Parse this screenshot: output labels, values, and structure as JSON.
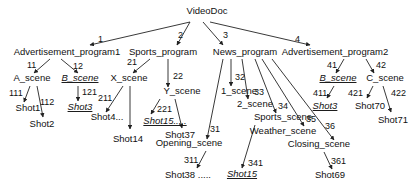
{
  "diagram": {
    "root": {
      "id": "root",
      "label": "VideoDoc",
      "x": 207,
      "y": 14
    },
    "nodes": [
      {
        "id": "ap1",
        "label": "Advertisement_program1",
        "x": 67,
        "y": 55
      },
      {
        "id": "sp",
        "label": "Sports_program",
        "x": 163,
        "y": 55
      },
      {
        "id": "np",
        "label": "News_program",
        "x": 245,
        "y": 55
      },
      {
        "id": "ap2",
        "label": "Advertisement_program2",
        "x": 335,
        "y": 55
      },
      {
        "id": "as",
        "label": "A_scene",
        "x": 32,
        "y": 81
      },
      {
        "id": "bs1",
        "label": "B_scene",
        "x": 80,
        "y": 81,
        "italic": true
      },
      {
        "id": "xs",
        "label": "X_scene",
        "x": 129,
        "y": 81
      },
      {
        "id": "ys",
        "label": "Y_scene",
        "x": 182,
        "y": 94
      },
      {
        "id": "s1",
        "label": "1_scene",
        "x": 239,
        "y": 94
      },
      {
        "id": "s2",
        "label": "2_scene",
        "x": 255,
        "y": 107
      },
      {
        "id": "sps",
        "label": "Sports_scene",
        "x": 283,
        "y": 120
      },
      {
        "id": "ws",
        "label": "Weather_scene",
        "x": 283,
        "y": 134
      },
      {
        "id": "os",
        "label": "Opening_scene",
        "x": 189,
        "y": 146
      },
      {
        "id": "cs",
        "label": "Closing_scene",
        "x": 319,
        "y": 147
      },
      {
        "id": "bs2",
        "label": "B_scene",
        "x": 338,
        "y": 81,
        "italic": true
      },
      {
        "id": "cs2",
        "label": "C_scene",
        "x": 385,
        "y": 81
      },
      {
        "id": "sh1",
        "label": "Shot1",
        "x": 28,
        "y": 111
      },
      {
        "id": "sh2",
        "label": "Shot2",
        "x": 42,
        "y": 127
      },
      {
        "id": "sh3a",
        "label": "Shot3",
        "x": 80,
        "y": 110,
        "italic": true
      },
      {
        "id": "sh4",
        "label": "Shot4...",
        "x": 107,
        "y": 120
      },
      {
        "id": "sh14",
        "label": "Shot14",
        "x": 128,
        "y": 142
      },
      {
        "id": "sh15a",
        "label": "Shot15.....",
        "x": 165,
        "y": 124,
        "italic": true
      },
      {
        "id": "sh37",
        "label": "Shot37",
        "x": 180,
        "y": 138
      },
      {
        "id": "sh38",
        "label": "Shot38 .....",
        "x": 188,
        "y": 178
      },
      {
        "id": "sh15b",
        "label": "Shot15",
        "x": 242,
        "y": 177,
        "italic": true
      },
      {
        "id": "sh69",
        "label": "Shot69",
        "x": 330,
        "y": 178
      },
      {
        "id": "sh3b",
        "label": "Shot3",
        "x": 325,
        "y": 109,
        "italic": true
      },
      {
        "id": "sh70",
        "label": "Shot70",
        "x": 370,
        "y": 109
      },
      {
        "id": "sh71",
        "label": "Shot71",
        "x": 393,
        "y": 123
      }
    ],
    "edges": [
      {
        "from": "root",
        "to": "ap1",
        "label": "1",
        "x1": 190,
        "y1": 22,
        "x2": 90,
        "y2": 45,
        "lx": 98,
        "ly": 42
      },
      {
        "from": "root",
        "to": "sp",
        "label": "2",
        "x1": 190,
        "y1": 22,
        "x2": 177,
        "y2": 45,
        "lx": 178,
        "ly": 38
      },
      {
        "from": "root",
        "to": "np",
        "label": "3",
        "x1": 203,
        "y1": 22,
        "x2": 223,
        "y2": 45,
        "lx": 223,
        "ly": 38
      },
      {
        "from": "root",
        "to": "ap2",
        "label": "4",
        "x1": 210,
        "y1": 22,
        "x2": 310,
        "y2": 45,
        "lx": 295,
        "ly": 42
      },
      {
        "from": "ap1",
        "to": "as",
        "label": "11",
        "x1": 50,
        "y1": 59,
        "x2": 34,
        "y2": 73,
        "lx": 27,
        "ly": 68
      },
      {
        "from": "ap1",
        "to": "bs1",
        "label": "12",
        "x1": 61,
        "y1": 59,
        "x2": 78,
        "y2": 73,
        "lx": 73,
        "ly": 69
      },
      {
        "from": "sp",
        "to": "xs",
        "label": "21",
        "x1": 150,
        "y1": 59,
        "x2": 133,
        "y2": 73,
        "lx": 127,
        "ly": 65
      },
      {
        "from": "sp",
        "to": "ys",
        "label": "22",
        "x1": 168,
        "y1": 59,
        "x2": 168,
        "y2": 87,
        "lx": 173,
        "ly": 79
      },
      {
        "from": "np",
        "to": "os",
        "label": "31",
        "x1": 223,
        "y1": 59,
        "x2": 207,
        "y2": 139,
        "lx": 210,
        "ly": 132
      },
      {
        "from": "np",
        "to": "s1",
        "label": "32",
        "x1": 231,
        "y1": 59,
        "x2": 231,
        "y2": 86,
        "lx": 235,
        "ly": 80
      },
      {
        "from": "np",
        "to": "s2",
        "label": "33",
        "x1": 242,
        "y1": 59,
        "x2": 248,
        "y2": 99,
        "lx": 254,
        "ly": 95
      },
      {
        "from": "np",
        "to": "sps",
        "label": "34",
        "x1": 255,
        "y1": 59,
        "x2": 276,
        "y2": 113,
        "lx": 278,
        "ly": 109
      },
      {
        "from": "np",
        "to": "ws",
        "label": "35",
        "x1": 262,
        "y1": 59,
        "x2": 304,
        "y2": 126,
        "lx": 306,
        "ly": 122
      },
      {
        "from": "np",
        "to": "cs",
        "label": "36",
        "x1": 272,
        "y1": 59,
        "x2": 334,
        "y2": 140,
        "lx": 325,
        "ly": 129
      },
      {
        "from": "ap2",
        "to": "bs2",
        "label": "41",
        "x1": 344,
        "y1": 59,
        "x2": 336,
        "y2": 73,
        "lx": 327,
        "ly": 68
      },
      {
        "from": "ap2",
        "to": "cs2",
        "label": "42",
        "x1": 366,
        "y1": 59,
        "x2": 374,
        "y2": 73,
        "lx": 376,
        "ly": 68
      },
      {
        "from": "as",
        "to": "sh1",
        "label": "111",
        "x1": 30,
        "y1": 86,
        "x2": 24,
        "y2": 102,
        "lx": 9,
        "ly": 96
      },
      {
        "from": "as",
        "to": "sh2",
        "label": "112",
        "x1": 37,
        "y1": 86,
        "x2": 43,
        "y2": 117,
        "lx": 40,
        "ly": 105
      },
      {
        "from": "bs1",
        "to": "sh3a",
        "label": "121",
        "x1": 78,
        "y1": 86,
        "x2": 78,
        "y2": 101,
        "lx": 82,
        "ly": 95
      },
      {
        "from": "xs",
        "to": "sh4",
        "label": "211",
        "x1": 123,
        "y1": 86,
        "x2": 106,
        "y2": 112,
        "lx": 98,
        "ly": 101
      },
      {
        "from": "xs",
        "to": "sh14",
        "label": "",
        "x1": 130,
        "y1": 86,
        "x2": 130,
        "y2": 129,
        "lx": 0,
        "ly": 0
      },
      {
        "from": "ys",
        "to": "sh15a",
        "label": "221",
        "x1": 160,
        "y1": 99,
        "x2": 151,
        "y2": 114,
        "lx": 157,
        "ly": 112
      },
      {
        "from": "ys",
        "to": "sh37",
        "label": "",
        "x1": 175,
        "y1": 99,
        "x2": 182,
        "y2": 128,
        "lx": 0,
        "ly": 0
      },
      {
        "from": "os",
        "to": "sh38",
        "label": "311",
        "x1": 206,
        "y1": 151,
        "x2": 197,
        "y2": 168,
        "lx": 184,
        "ly": 163
      },
      {
        "from": "sps",
        "to": "sh15b",
        "label": "341",
        "x1": 255,
        "y1": 125,
        "x2": 242,
        "y2": 168,
        "lx": 248,
        "ly": 166
      },
      {
        "from": "cs",
        "to": "sh69",
        "label": "361",
        "x1": 324,
        "y1": 152,
        "x2": 332,
        "y2": 169,
        "lx": 331,
        "ly": 164
      },
      {
        "from": "bs2",
        "to": "sh3b",
        "label": "411",
        "x1": 334,
        "y1": 86,
        "x2": 327,
        "y2": 98,
        "lx": 313,
        "ly": 96
      },
      {
        "from": "cs2",
        "to": "sh70",
        "label": "421",
        "x1": 373,
        "y1": 86,
        "x2": 367,
        "y2": 98,
        "lx": 348,
        "ly": 96
      },
      {
        "from": "cs2",
        "to": "sh71",
        "label": "422",
        "x1": 383,
        "y1": 86,
        "x2": 391,
        "y2": 112,
        "lx": 391,
        "ly": 96
      }
    ]
  }
}
